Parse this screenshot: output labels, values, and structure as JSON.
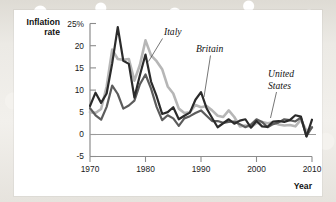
{
  "chart_data": {
    "type": "line",
    "title": "",
    "xlabel": "Year",
    "ylabel_line1": "Inflation",
    "ylabel_line2": "rate",
    "xlim": [
      1970,
      2010
    ],
    "ylim": [
      -5,
      25
    ],
    "xticks": [
      "1970",
      "1980",
      "1990",
      "2000",
      "2010"
    ],
    "xtick_values": [
      1970,
      1980,
      1990,
      2000,
      2010
    ],
    "yticks": [
      "25%",
      "20",
      "15",
      "10",
      "5",
      "0",
      "-5"
    ],
    "ytick_values": [
      25,
      20,
      15,
      10,
      5,
      0,
      -5
    ],
    "grid": false,
    "legend_position": "inline-annotations",
    "x": [
      1970,
      1971,
      1972,
      1973,
      1974,
      1975,
      1976,
      1977,
      1978,
      1979,
      1980,
      1981,
      1982,
      1983,
      1984,
      1985,
      1986,
      1987,
      1988,
      1989,
      1990,
      1991,
      1992,
      1993,
      1994,
      1995,
      1996,
      1997,
      1998,
      1999,
      2000,
      2001,
      2002,
      2003,
      2004,
      2005,
      2006,
      2007,
      2008,
      2009,
      2010
    ],
    "series": [
      {
        "name": "Britain",
        "color": "#2b2b2b",
        "label_x": 1993.2,
        "label_y": 22.2,
        "values": [
          6.4,
          9.4,
          7.1,
          9.2,
          16.0,
          24.2,
          16.6,
          15.9,
          8.3,
          13.4,
          18.0,
          11.9,
          8.6,
          4.6,
          5.0,
          6.1,
          3.4,
          4.2,
          4.9,
          7.8,
          9.5,
          5.9,
          3.7,
          1.6,
          2.5,
          3.4,
          2.4,
          3.1,
          3.4,
          1.5,
          3.0,
          1.8,
          1.7,
          2.9,
          3.0,
          2.8,
          3.2,
          4.3,
          4.0,
          -0.5,
          3.3
        ]
      },
      {
        "name": "United States",
        "color": "#5c5c5c",
        "label_x": 2001.5,
        "label_y": 16.0,
        "values": [
          5.9,
          4.3,
          3.3,
          6.2,
          11.0,
          9.1,
          5.8,
          6.5,
          7.6,
          11.3,
          13.5,
          10.3,
          6.2,
          3.2,
          4.3,
          3.6,
          1.9,
          3.6,
          4.1,
          4.8,
          5.4,
          4.2,
          3.0,
          3.0,
          2.6,
          2.8,
          2.9,
          2.3,
          1.6,
          2.2,
          3.4,
          2.8,
          1.6,
          2.3,
          2.7,
          3.4,
          3.2,
          2.9,
          3.8,
          -0.4,
          1.6
        ]
      },
      {
        "name": "Italy",
        "color": "#b6b6b6",
        "label_x": 1981.6,
        "label_y": 23.0,
        "values": [
          5.0,
          4.8,
          5.7,
          10.8,
          19.1,
          17.0,
          16.8,
          17.0,
          12.1,
          15.7,
          21.2,
          17.8,
          16.5,
          14.7,
          10.8,
          9.2,
          5.8,
          4.8,
          5.0,
          6.6,
          6.1,
          6.4,
          5.4,
          4.2,
          3.9,
          5.4,
          3.9,
          1.8,
          2.0,
          1.7,
          2.5,
          2.8,
          2.5,
          2.7,
          2.2,
          2.0,
          2.1,
          1.8,
          3.3,
          0.8,
          1.5
        ]
      }
    ],
    "annotations": [
      {
        "name": "italy-label",
        "text": "Italy"
      },
      {
        "name": "britain-label",
        "text": "Britain"
      },
      {
        "name": "united-states-label-line1",
        "text": "United"
      },
      {
        "name": "united-states-label-line2",
        "text": "States"
      }
    ]
  }
}
